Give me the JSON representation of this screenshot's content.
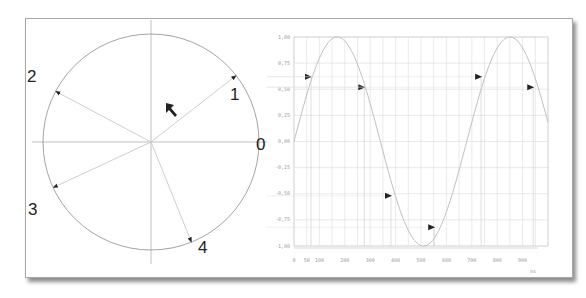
{
  "phasor": {
    "labels": [
      "0",
      "1",
      "2",
      "3",
      "4"
    ],
    "angles_deg": [
      0,
      38,
      152,
      205,
      292
    ],
    "colors": {
      "circle": "#9a9a9a",
      "axis": "#b0b0b0",
      "vector": "#c8c8c8",
      "arrowhead": "#222222"
    }
  },
  "chart": {
    "y_ticks": [
      "1,00",
      "0,75",
      "0,50",
      "0,25",
      "0,00",
      "-0,25",
      "-0,50",
      "-0,75",
      "-1,00"
    ],
    "x_ticks": [
      "0",
      "50",
      "100",
      "200",
      "300",
      "400",
      "500",
      "600",
      "700",
      "800",
      "900"
    ],
    "x_unit": "ns"
  },
  "chart_data": {
    "type": "line",
    "title": "",
    "xlabel": "ns",
    "ylabel": "",
    "xlim": [
      0,
      1000
    ],
    "ylim": [
      -1.05,
      1.05
    ],
    "grid": true,
    "series": [
      {
        "name": "sine",
        "x": [
          0,
          50,
          100,
          150,
          170,
          200,
          250,
          300,
          350,
          400,
          450,
          500,
          550,
          600,
          650,
          700,
          750,
          800,
          840,
          900,
          950,
          1000
        ],
        "values": [
          0.0,
          0.44,
          0.8,
          0.98,
          1.0,
          0.98,
          0.8,
          0.44,
          0.0,
          -0.44,
          -0.8,
          -0.98,
          -0.98,
          -0.8,
          -0.44,
          0.0,
          0.44,
          0.8,
          1.0,
          0.8,
          0.44,
          0.0
        ]
      }
    ],
    "markers": [
      {
        "x": 55,
        "y": 0.62
      },
      {
        "x": 265,
        "y": 0.52
      },
      {
        "x": 370,
        "y": -0.52
      },
      {
        "x": 540,
        "y": -0.82
      },
      {
        "x": 725,
        "y": 0.62
      },
      {
        "x": 930,
        "y": 0.52
      }
    ]
  }
}
